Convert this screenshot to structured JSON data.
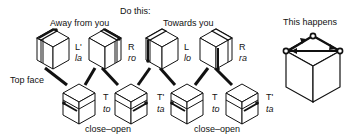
{
  "headings": {
    "do_this": "Do this:",
    "away": "Away from you",
    "towards": "Towards you",
    "result": "This happens",
    "top_face": "Top face"
  },
  "top_row": [
    {
      "move": "L'",
      "syllable": "la"
    },
    {
      "move": "R",
      "syllable": "ro"
    },
    {
      "move": "L",
      "syllable": "lo"
    },
    {
      "move": "R",
      "syllable": "ra"
    }
  ],
  "bottom_row": [
    {
      "move": "T",
      "syllable": "to"
    },
    {
      "move": "T'",
      "syllable": "ta"
    },
    {
      "move": "T",
      "syllable": "to"
    },
    {
      "move": "T'",
      "syllable": "ta"
    }
  ],
  "captions": {
    "close_open_1": "close–open",
    "close_open_2": "close–open"
  },
  "colors": {
    "ink": "#111111",
    "background": "#ffffff"
  }
}
